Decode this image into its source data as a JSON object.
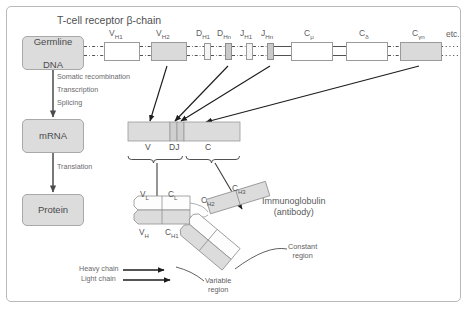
{
  "figure": {
    "title": "T-cell receptor β-chain",
    "background": "#ffffff",
    "border_color": "#b9b9b9"
  },
  "flow": {
    "stages": [
      {
        "id": "germline",
        "label_line1": "Germline",
        "label_line2": "DNA"
      },
      {
        "id": "mrna",
        "label_line1": "mRNA",
        "label_line2": ""
      },
      {
        "id": "protein",
        "label_line1": "Protein",
        "label_line2": ""
      }
    ],
    "processes": [
      {
        "id": "somatic-recombination",
        "label": "Somatic recombination"
      },
      {
        "id": "transcription",
        "label": "Transcription"
      },
      {
        "id": "splicing",
        "label": "Splicing"
      },
      {
        "id": "translation",
        "label": "Translation"
      }
    ]
  },
  "germline_locus": {
    "segments": [
      {
        "id": "vh1",
        "base": "V",
        "sub": "H1",
        "fill": "#ffffff",
        "x": 104,
        "w": 36,
        "h": 19
      },
      {
        "id": "vh2",
        "base": "V",
        "sub": "H2",
        "fill": "#dadada",
        "x": 151,
        "w": 36,
        "h": 19
      },
      {
        "id": "dh1",
        "base": "D",
        "sub": "H1",
        "fill": "#f4f4f4",
        "x": 204,
        "w": 7,
        "h": 17
      },
      {
        "id": "dhn",
        "base": "D",
        "sub": "Hn",
        "fill": "#cfcfcf",
        "x": 225,
        "w": 7,
        "h": 17
      },
      {
        "id": "jh1",
        "base": "J",
        "sub": "H1",
        "fill": "#f4f4f4",
        "x": 246,
        "w": 7,
        "h": 17
      },
      {
        "id": "jhn",
        "base": "J",
        "sub": "Hn",
        "fill": "#cfcfcf",
        "x": 267,
        "w": 7,
        "h": 17
      },
      {
        "id": "cmu",
        "base": "C",
        "sub": "μ",
        "fill": "#ffffff",
        "x": 291,
        "w": 42,
        "h": 19
      },
      {
        "id": "cdelta",
        "base": "C",
        "sub": "δ",
        "fill": "#ffffff",
        "x": 346,
        "w": 42,
        "h": 19
      },
      {
        "id": "cgamman",
        "base": "C",
        "sub": "γn",
        "fill": "#dadada",
        "x": 400,
        "w": 42,
        "h": 19
      }
    ],
    "trailing_label": "etc."
  },
  "rearranged_gene": {
    "parts": [
      {
        "id": "v",
        "label": "V",
        "x": 128,
        "w": 42,
        "fill": "#dcdcdc"
      },
      {
        "id": "dj",
        "label": "DJ",
        "x": 170,
        "w": 14,
        "fill": "#cbcbcb"
      },
      {
        "id": "c",
        "label": "C",
        "x": 184,
        "w": 56,
        "fill": "#dcdcdc"
      }
    ]
  },
  "immunoglobulin": {
    "title_line1": "Immunoglobulin",
    "title_line2": "(antibody)",
    "domains": [
      {
        "id": "vl",
        "base": "V",
        "sub": "L",
        "x": 140,
        "y": 190
      },
      {
        "id": "cl",
        "base": "C",
        "sub": "L",
        "x": 168,
        "y": 190
      },
      {
        "id": "vh",
        "base": "V",
        "sub": "H",
        "x": 139,
        "y": 228
      },
      {
        "id": "ch1",
        "base": "C",
        "sub": "H1",
        "x": 165,
        "y": 228
      },
      {
        "id": "ch2",
        "base": "C",
        "sub": "H2",
        "x": 201,
        "y": 196
      },
      {
        "id": "ch3",
        "base": "C",
        "sub": "H3",
        "x": 232,
        "y": 184
      }
    ],
    "annotations": [
      {
        "id": "constant-region",
        "line1": "Constant",
        "line2": "region"
      },
      {
        "id": "variable-region",
        "line1": "Variable",
        "line2": "region"
      }
    ],
    "chain_callouts": [
      {
        "id": "heavy-chain",
        "label": "Heavy chain"
      },
      {
        "id": "light-chain",
        "label": "Light chain"
      }
    ]
  }
}
